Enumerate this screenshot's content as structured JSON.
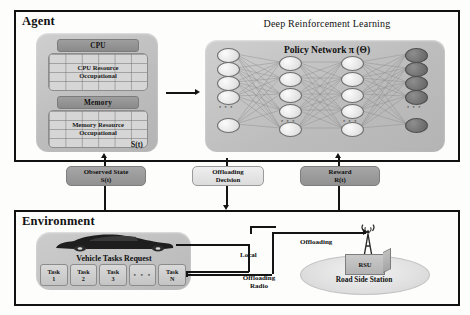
{
  "figure": {
    "agent": {
      "title": "Agent",
      "state_label": "S(t)",
      "cpu": {
        "header": "CPU",
        "grid_line1": "CPU Resource",
        "grid_line2": "Occupational"
      },
      "memory": {
        "header": "Memory",
        "grid_line1": "Memory Resource",
        "grid_line2": "Occupational"
      },
      "drl": {
        "title": "Deep Reinforcement Learning",
        "policy_title": "Policy Network π (Θ)",
        "ellipsis": "• • •"
      }
    },
    "signals": [
      {
        "name": "observed-state",
        "line1": "Observed State",
        "line2": "S(t)",
        "style": "dark"
      },
      {
        "name": "offloading-decision",
        "line1": "Offloading",
        "line2": "Decision",
        "style": "light"
      },
      {
        "name": "reward",
        "line1": "Reward",
        "line2": "R(t)",
        "style": "dark"
      }
    ],
    "environment": {
      "title": "Environment",
      "vehicle_tasks_request": "Vehicle Tasks Request",
      "tasks": [
        {
          "line1": "Task",
          "line2": "1"
        },
        {
          "line1": "Task",
          "line2": "2"
        },
        {
          "line1": "Task",
          "line2": "3"
        },
        {
          "line1": "• • •",
          "line2": ""
        },
        {
          "line1": "Task",
          "line2": "N"
        }
      ],
      "local_label": "Local",
      "offloading_radio_label_1": "Offloading",
      "offloading_radio_label_2": "Radio",
      "offloading_label": "Offloading",
      "rsu_label": "RSU",
      "road_side_station": "Road Side Station"
    }
  },
  "chart_data": {
    "type": "diagram",
    "network": {
      "name": "Policy Network π (Θ)",
      "layers": [
        {
          "name": "input",
          "nodes": 5,
          "shade": "light",
          "has_ellipsis": true
        },
        {
          "name": "hidden1",
          "nodes": 5,
          "shade": "light",
          "has_ellipsis": true
        },
        {
          "name": "hidden2",
          "nodes": 5,
          "shade": "light",
          "has_ellipsis": true
        },
        {
          "name": "output",
          "nodes": 5,
          "shade": "dark",
          "has_ellipsis": true
        }
      ]
    },
    "flows": [
      {
        "from": "Environment",
        "to": "Agent",
        "label": "Observed State S(t)"
      },
      {
        "from": "Agent",
        "to": "Environment",
        "label": "Offloading Decision"
      },
      {
        "from": "Environment",
        "to": "Agent",
        "label": "Reward R(t)"
      },
      {
        "from": "Vehicle",
        "to": "Vehicle",
        "label": "Local"
      },
      {
        "from": "Vehicle",
        "to": "RSU",
        "label": "Offloading"
      }
    ]
  },
  "colors": {
    "frame": "#111111",
    "plate": "#c4c4c4",
    "node_light": "#e8e8e8",
    "node_dark": "#707070",
    "signal_dark": "#9b9b9b",
    "signal_light": "#e4e4e4"
  }
}
